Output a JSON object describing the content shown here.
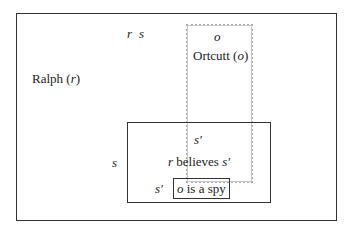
{
  "diagram": {
    "outer_box": {
      "label_entity": "Ralph",
      "label_var": "r",
      "top_label_r": "r",
      "top_label_s": "s"
    },
    "ortcutt_box": {
      "var_label": "o",
      "name": "Ortcutt",
      "name_var": "o",
      "style": "dotted",
      "color": "#a8a8a8"
    },
    "belief_box": {
      "side_label": "s",
      "top_label": "s′",
      "relation_subject": "r",
      "relation_verb": "believes",
      "relation_object": "s′"
    },
    "proposition_box": {
      "side_label": "s′",
      "subject": "o",
      "predicate": "is a spy"
    }
  }
}
